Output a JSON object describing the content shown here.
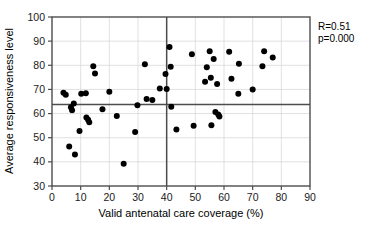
{
  "chart_data": {
    "type": "scatter",
    "title": "",
    "xlabel": "Valid antenatal care coverage (%)",
    "ylabel": "Average responsiveness level",
    "xlim": [
      0,
      90
    ],
    "ylim": [
      30,
      100
    ],
    "xticks": [
      0,
      10,
      20,
      30,
      40,
      50,
      60,
      70,
      80,
      90
    ],
    "yticks": [
      30,
      40,
      50,
      60,
      70,
      80,
      90,
      100
    ],
    "grid": true,
    "legend": "none",
    "annotations": {
      "correlation": "R=0.51",
      "pvalue": "p=0.000"
    },
    "reference_lines": {
      "vertical_x": 40,
      "horizontal_y": 63.8
    },
    "points": [
      {
        "x": 4.0,
        "y": 68.6
      },
      {
        "x": 4.8,
        "y": 67.8
      },
      {
        "x": 6.0,
        "y": 46.4
      },
      {
        "x": 6.6,
        "y": 62.6
      },
      {
        "x": 7.0,
        "y": 61.4
      },
      {
        "x": 7.6,
        "y": 64.2
      },
      {
        "x": 8.0,
        "y": 43.0
      },
      {
        "x": 9.6,
        "y": 52.8
      },
      {
        "x": 10.2,
        "y": 68.2
      },
      {
        "x": 11.8,
        "y": 68.4
      },
      {
        "x": 12.0,
        "y": 58.4
      },
      {
        "x": 12.6,
        "y": 57.4
      },
      {
        "x": 13.0,
        "y": 56.4
      },
      {
        "x": 14.4,
        "y": 79.6
      },
      {
        "x": 15.0,
        "y": 76.6
      },
      {
        "x": 17.6,
        "y": 61.8
      },
      {
        "x": 20.0,
        "y": 69.0
      },
      {
        "x": 22.6,
        "y": 59.0
      },
      {
        "x": 25.0,
        "y": 39.2
      },
      {
        "x": 29.0,
        "y": 52.4
      },
      {
        "x": 29.8,
        "y": 63.4
      },
      {
        "x": 32.4,
        "y": 80.4
      },
      {
        "x": 33.0,
        "y": 66.0
      },
      {
        "x": 35.0,
        "y": 65.6
      },
      {
        "x": 37.6,
        "y": 70.4
      },
      {
        "x": 39.6,
        "y": 76.4
      },
      {
        "x": 40.0,
        "y": 70.2
      },
      {
        "x": 41.4,
        "y": 79.4
      },
      {
        "x": 41.0,
        "y": 87.6
      },
      {
        "x": 41.6,
        "y": 62.8
      },
      {
        "x": 43.4,
        "y": 53.4
      },
      {
        "x": 48.8,
        "y": 84.6
      },
      {
        "x": 49.4,
        "y": 55.0
      },
      {
        "x": 53.4,
        "y": 73.2
      },
      {
        "x": 54.0,
        "y": 79.2
      },
      {
        "x": 55.0,
        "y": 85.8
      },
      {
        "x": 55.4,
        "y": 74.8
      },
      {
        "x": 55.6,
        "y": 55.2
      },
      {
        "x": 56.4,
        "y": 82.6
      },
      {
        "x": 57.0,
        "y": 60.6
      },
      {
        "x": 57.6,
        "y": 72.2
      },
      {
        "x": 58.4,
        "y": 58.8
      },
      {
        "x": 58.0,
        "y": 59.6
      },
      {
        "x": 61.8,
        "y": 85.6
      },
      {
        "x": 62.6,
        "y": 74.4
      },
      {
        "x": 65.0,
        "y": 68.2
      },
      {
        "x": 65.2,
        "y": 80.6
      },
      {
        "x": 70.0,
        "y": 70.0
      },
      {
        "x": 73.4,
        "y": 79.6
      },
      {
        "x": 74.0,
        "y": 85.8
      },
      {
        "x": 77.0,
        "y": 83.2
      }
    ]
  }
}
